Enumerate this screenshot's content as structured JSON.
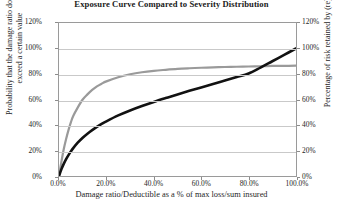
{
  "chart_data": {
    "type": "line",
    "title": "Exposure Curve Compared to Severity Distribution",
    "xlabel": "Damage ratio/Deductible as a % of max loss/sum insured",
    "ylabel_left": "Probability that the damage ratio does not exceed a certain value",
    "ylabel_right": "Percentage of risk retained by (re)insured",
    "xlim": [
      0,
      100
    ],
    "ylim": [
      0,
      120
    ],
    "grid": true,
    "legend": "none",
    "x_ticks": [
      "0.0%",
      "20.0%",
      "40.0%",
      "60.0%",
      "80.0%",
      "100.0%"
    ],
    "x_tick_values": [
      0,
      20,
      40,
      60,
      80,
      100
    ],
    "y_ticks_left": [
      "0%",
      "20%",
      "40%",
      "60%",
      "80%",
      "100%",
      "120%"
    ],
    "y_ticks_right": [
      "0%",
      "20%",
      "40%",
      "60%",
      "80%",
      "100%",
      "120%"
    ],
    "y_tick_values": [
      0,
      20,
      40,
      60,
      80,
      100,
      120
    ],
    "series": [
      {
        "name": "Severity distribution",
        "color": "#9a9a9a",
        "width": 2.2,
        "x": [
          0,
          1,
          2,
          3,
          4,
          5,
          6,
          8,
          10,
          12,
          14,
          16,
          18,
          20,
          25,
          30,
          35,
          40,
          45,
          50,
          55,
          60,
          65,
          70,
          75,
          80,
          85,
          90,
          95,
          100
        ],
        "y": [
          0,
          11,
          21,
          29,
          36,
          42,
          47,
          54,
          60,
          64,
          67.5,
          70.3,
          72.4,
          74.2,
          77.5,
          79.8,
          81.4,
          82.5,
          83.3,
          84.0,
          84.5,
          84.9,
          85.2,
          85.5,
          85.7,
          85.9,
          86.1,
          86.3,
          86.4,
          86.5
        ]
      },
      {
        "name": "Exposure curve",
        "color": "#121212",
        "width": 2.6,
        "x": [
          0,
          1,
          2,
          3,
          4,
          5,
          6,
          8,
          10,
          12,
          14,
          16,
          18,
          20,
          25,
          30,
          35,
          40,
          45,
          50,
          55,
          60,
          65,
          70,
          75,
          80,
          85,
          90,
          95,
          100
        ],
        "y": [
          0,
          5.2,
          9.5,
          13.2,
          16.4,
          19.3,
          21.9,
          26.3,
          30.0,
          33.2,
          36.0,
          38.5,
          40.8,
          42.9,
          47.5,
          51.4,
          54.9,
          58.1,
          61.1,
          64.0,
          66.8,
          69.5,
          72.2,
          74.9,
          77.6,
          80.4,
          85.0,
          90.0,
          95.0,
          100.0
        ]
      }
    ]
  }
}
